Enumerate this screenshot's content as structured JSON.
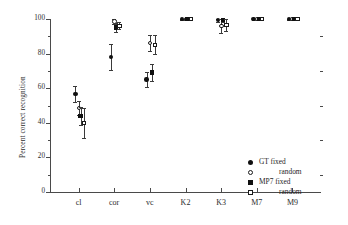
{
  "chart_data": {
    "type": "scatter",
    "title": "",
    "xlabel": "",
    "ylabel": "Percent correct recognition",
    "categories": [
      "cl",
      "cor",
      "vc",
      "K2",
      "K3",
      "M7",
      "M9"
    ],
    "ylim": [
      0,
      100
    ],
    "yticks": [
      0,
      20,
      40,
      60,
      80,
      100
    ],
    "yticklabels": [
      "0",
      "20",
      "40",
      "60",
      "80",
      "100"
    ],
    "minor_ticks": true,
    "grid": false,
    "legend_position": "lower right",
    "error_bars": "vertical",
    "series": [
      {
        "name": "GT fixed",
        "marker": "filled-circle",
        "color": "#101010",
        "values": [
          56.5,
          78.0,
          65.0,
          100.0,
          99.5,
          100.0,
          100.0
        ],
        "errors": [
          4.5,
          7.5,
          4.5,
          0.5,
          1.0,
          0.5,
          0.5
        ]
      },
      {
        "name": "random",
        "marker": "open-circle",
        "color": "#ffffff",
        "values": [
          48.5,
          98.5,
          86.0,
          100.0,
          96.0,
          100.0,
          100.0
        ],
        "errors": [
          4.0,
          1.5,
          4.5,
          0.5,
          4.0,
          0.5,
          0.5
        ]
      },
      {
        "name": "MP7 fixed",
        "marker": "filled-square",
        "color": "#101010",
        "values": [
          44.0,
          95.0,
          69.0,
          100.0,
          99.5,
          100.0,
          100.0
        ],
        "errors": [
          5.0,
          2.5,
          5.0,
          0.5,
          1.0,
          0.5,
          0.5
        ]
      },
      {
        "name": "random",
        "marker": "open-square",
        "color": "#ffffff",
        "values": [
          40.0,
          96.0,
          85.0,
          100.0,
          96.5,
          100.0,
          100.0
        ],
        "errors": [
          8.5,
          2.0,
          5.5,
          0.5,
          3.5,
          0.5,
          0.5
        ]
      }
    ]
  },
  "legend": {
    "entries": [
      {
        "label": "GT fixed",
        "marker": "filled-circle",
        "indent": false
      },
      {
        "label": "random",
        "marker": "open-circle",
        "indent": true
      },
      {
        "label": "MP7 fixed",
        "marker": "filled-square",
        "indent": false
      },
      {
        "label": "random",
        "marker": "open-square",
        "indent": true
      }
    ]
  },
  "axes": {
    "y_axis_label": "Percent correct recognition",
    "y_tick_labels": [
      "100",
      "80",
      "60",
      "40",
      "20",
      "0"
    ],
    "x_tick_labels": [
      "cl",
      "cor",
      "vc",
      "K2",
      "K3",
      "M7",
      "M9"
    ]
  },
  "colors": {
    "axis": "#4a4a4a",
    "marker_fill": "#101010",
    "marker_open": "#ffffff",
    "text": "#2b2b2b"
  }
}
